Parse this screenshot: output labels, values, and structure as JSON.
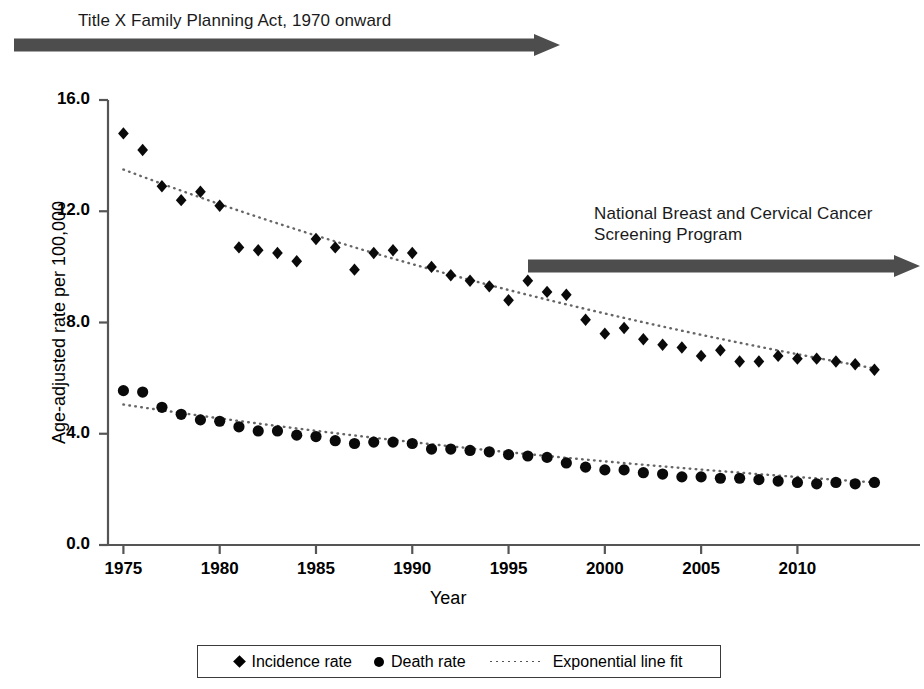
{
  "figure": {
    "background": "#ffffff",
    "ink_color": "#000000",
    "arrow_color": "#4d4d4d"
  },
  "annotations": [
    {
      "id": "title-x-act",
      "text": "Title X Family Planning Act, 1970 onward",
      "arrow": {
        "x_start": 14,
        "x_end": 560,
        "y": 45,
        "direction": "right"
      }
    },
    {
      "id": "nbccsp",
      "text": "National Breast and Cervical Cancer\nScreening Program",
      "arrow": {
        "x_start": 528,
        "x_end": 920,
        "y": 266,
        "direction": "right"
      }
    }
  ],
  "legend": {
    "items": [
      {
        "marker": "diamond-marker-icon",
        "label": "Incidence rate"
      },
      {
        "marker": "circle-marker-icon",
        "label": "Death rate"
      },
      {
        "marker": "dotted-line-icon",
        "label": "Exponential line fit"
      }
    ]
  },
  "chart_data": {
    "type": "scatter",
    "title": "",
    "xlabel": "Year",
    "ylabel": "Age-adjusted rate per 100,000",
    "xlim": [
      1974.2,
      2014.6
    ],
    "ylim": [
      0.0,
      16.0
    ],
    "grid": false,
    "legend_position": "bottom",
    "yticks": [
      0.0,
      4.0,
      8.0,
      12.0,
      16.0
    ],
    "ytick_labels": [
      "0.0",
      "4.0",
      "8.0",
      "12.0",
      "16.0"
    ],
    "xticks": [
      1975,
      1980,
      1985,
      1990,
      1995,
      2000,
      2005,
      2010
    ],
    "xtick_labels": [
      "1975",
      "1980",
      "1985",
      "1990",
      "1995",
      "2000",
      "2005",
      "2010"
    ],
    "x": [
      1975,
      1976,
      1977,
      1978,
      1979,
      1980,
      1981,
      1982,
      1983,
      1984,
      1985,
      1986,
      1987,
      1988,
      1989,
      1990,
      1991,
      1992,
      1993,
      1994,
      1995,
      1996,
      1997,
      1998,
      1999,
      2000,
      2001,
      2002,
      2003,
      2004,
      2005,
      2006,
      2007,
      2008,
      2009,
      2010,
      2011,
      2012,
      2013,
      2014
    ],
    "series": [
      {
        "name": "Incidence rate",
        "marker": "diamond",
        "values": [
          14.8,
          14.2,
          12.9,
          12.4,
          12.7,
          12.2,
          10.7,
          10.6,
          10.5,
          10.2,
          11.0,
          10.7,
          9.9,
          10.5,
          10.6,
          10.5,
          10.0,
          9.7,
          9.5,
          9.3,
          8.8,
          9.5,
          9.1,
          9.0,
          8.1,
          7.6,
          7.8,
          7.4,
          7.2,
          7.1,
          6.8,
          7.0,
          6.6,
          6.6,
          6.8,
          6.7,
          6.7,
          6.6,
          6.5,
          6.3
        ]
      },
      {
        "name": "Death rate",
        "marker": "circle",
        "values": [
          5.55,
          5.5,
          4.95,
          4.7,
          4.5,
          4.45,
          4.25,
          4.1,
          4.1,
          3.95,
          3.9,
          3.75,
          3.65,
          3.7,
          3.7,
          3.65,
          3.45,
          3.45,
          3.4,
          3.35,
          3.25,
          3.2,
          3.15,
          2.95,
          2.8,
          2.7,
          2.7,
          2.6,
          2.55,
          2.45,
          2.45,
          2.4,
          2.4,
          2.35,
          2.3,
          2.25,
          2.2,
          2.25,
          2.2,
          2.25
        ]
      }
    ],
    "fits": [
      {
        "name": "Exponential line fit (incidence)",
        "style": "dotted",
        "y_start": 13.5,
        "y_end": 6.35,
        "model": "exponential"
      },
      {
        "name": "Exponential line fit (death)",
        "style": "dotted",
        "y_start": 5.05,
        "y_end": 2.25,
        "model": "exponential"
      }
    ]
  }
}
